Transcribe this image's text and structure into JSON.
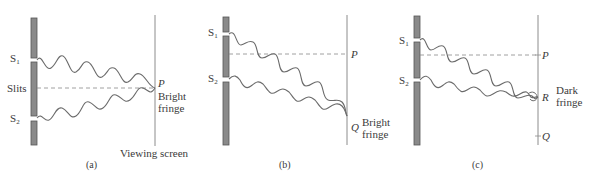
{
  "figure": {
    "panels": [
      {
        "id": "a",
        "caption": "(a)",
        "slit1_label": "S",
        "slit1_sub": "1",
        "slit2_label": "S",
        "slit2_sub": "2",
        "slits_label": "Slits",
        "point_label": "P",
        "fringe_line1": "Bright",
        "fringe_line2": "fringe",
        "screen_label": "Viewing screen"
      },
      {
        "id": "b",
        "caption": "(b)",
        "slit1_label": "S",
        "slit1_sub": "1",
        "slit2_label": "S",
        "slit2_sub": "2",
        "point_p_label": "P",
        "point_q_label": "Q",
        "fringe_line1": "Bright",
        "fringe_line2": "fringe"
      },
      {
        "id": "c",
        "caption": "(c)",
        "slit1_label": "S",
        "slit1_sub": "1",
        "slit2_label": "S",
        "slit2_sub": "2",
        "point_p_label": "P",
        "point_r_label": "R",
        "point_q_label": "Q",
        "fringe_line1": "Dark",
        "fringe_line2": "fringe"
      }
    ],
    "colors": {
      "barrier_fill": "#8a8a8a",
      "barrier_stroke": "#555555",
      "wave": "#6b6b6b",
      "screen": "#8c8c8c",
      "text": "#3a3a3a"
    }
  }
}
